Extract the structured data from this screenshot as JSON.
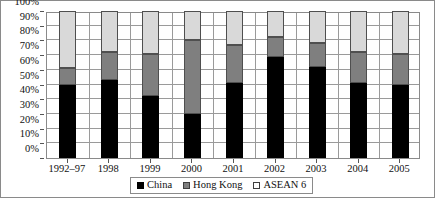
{
  "chart_data": {
    "type": "bar",
    "stacked": true,
    "stack_mode": "percent",
    "title": "",
    "subtitle": "",
    "xlabel": "",
    "ylabel": "",
    "ylim": [
      0,
      100
    ],
    "y_tick_labels": [
      "0%",
      "10%",
      "20%",
      "30%",
      "40%",
      "50%",
      "60%",
      "70%",
      "80%",
      "90%",
      "100%"
    ],
    "y_tick_values": [
      0,
      10,
      20,
      30,
      40,
      50,
      60,
      70,
      80,
      90,
      100
    ],
    "grid": true,
    "grid_orientation": "both",
    "legend_position": "bottom-center",
    "categories": [
      "1992–97",
      "1998",
      "1999",
      "2000",
      "2001",
      "2002",
      "2003",
      "2004",
      "2005"
    ],
    "series": [
      {
        "name": "China",
        "color": "#000000",
        "values": [
          50,
          53,
          42,
          30,
          51,
          69,
          62,
          51,
          50
        ]
      },
      {
        "name": "Hong Kong",
        "color": "#7f7f7f",
        "values": [
          11,
          19,
          29,
          50,
          26,
          13,
          16,
          21,
          21
        ]
      },
      {
        "name": "ASEAN 6",
        "color": "#d9d9d9",
        "values": [
          39,
          28,
          29,
          20,
          23,
          18,
          22,
          28,
          29
        ]
      }
    ],
    "cumulative_tops": [
      [
        50,
        61,
        100
      ],
      [
        53,
        72,
        100
      ],
      [
        42,
        71,
        100
      ],
      [
        30,
        80,
        100
      ],
      [
        51,
        77,
        100
      ],
      [
        69,
        82,
        100
      ],
      [
        62,
        78,
        100
      ],
      [
        51,
        72,
        100
      ],
      [
        50,
        71,
        100
      ]
    ]
  },
  "legend": {
    "items": [
      {
        "label": "China",
        "swatch": "black-square-icon"
      },
      {
        "label": "Hong Kong",
        "swatch": "gray-square-icon"
      },
      {
        "label": "ASEAN 6",
        "swatch": "white-square-icon"
      }
    ]
  },
  "colors": {
    "china": "#000000",
    "hong_kong": "#7f7f7f",
    "asean_6": "#d9d9d9",
    "frame": "#8a8a8a",
    "gridline": "#9a9a9a",
    "text": "#111111"
  }
}
